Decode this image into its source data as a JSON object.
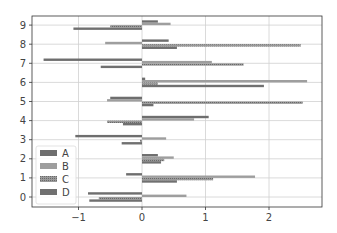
{
  "chart_data": {
    "type": "bar",
    "orientation": "horizontal",
    "title": "",
    "xlabel": "",
    "ylabel": "",
    "categories": [
      "0",
      "1",
      "2",
      "3",
      "4",
      "5",
      "6",
      "7",
      "8",
      "9"
    ],
    "series": [
      {
        "name": "A",
        "color": "#6e6e6e",
        "hatch": "none",
        "values": [
          -0.85,
          -0.25,
          0.25,
          -1.05,
          1.05,
          -0.5,
          0.05,
          -1.55,
          0.42,
          0.25
        ]
      },
      {
        "name": "B",
        "color": "#9e9e9e",
        "hatch": "none",
        "values": [
          0.7,
          1.78,
          0.5,
          0.38,
          0.82,
          -0.55,
          2.6,
          1.1,
          -0.58,
          0.45
        ]
      },
      {
        "name": "C",
        "color": "#8a8a8a",
        "hatch": "dots",
        "values": [
          -0.68,
          1.12,
          0.35,
          -0.03,
          -0.55,
          2.53,
          0.25,
          1.6,
          2.5,
          -0.5
        ]
      },
      {
        "name": "D",
        "color": "#707070",
        "hatch": "none",
        "values": [
          -0.83,
          0.55,
          0.3,
          -0.32,
          -0.3,
          0.18,
          1.92,
          -0.65,
          0.55,
          -1.08
        ]
      }
    ],
    "xlim": [
      -1.7,
      2.8
    ],
    "ylim": [
      -0.55,
      9.5
    ],
    "xticks": [
      -1,
      0,
      1,
      2
    ],
    "yticks": [
      0,
      1,
      2,
      3,
      4,
      5,
      6,
      7,
      8,
      9
    ],
    "grid": true,
    "legend_position": "lower left"
  },
  "axes": {
    "x_tick_labels": [
      "−1",
      "0",
      "1",
      "2"
    ],
    "y_tick_labels": [
      "0",
      "1",
      "2",
      "3",
      "4",
      "5",
      "6",
      "7",
      "8",
      "9"
    ]
  },
  "legend": {
    "entries": [
      "A",
      "B",
      "C",
      "D"
    ]
  }
}
